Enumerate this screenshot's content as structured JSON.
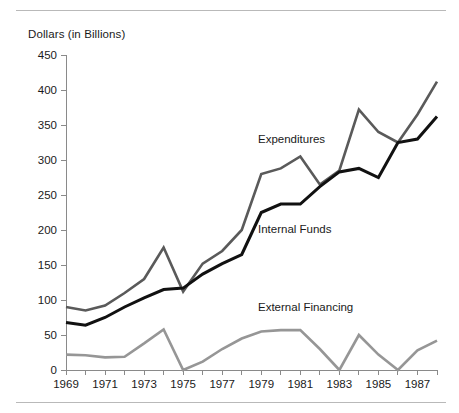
{
  "chart_data": {
    "type": "line",
    "title": "",
    "ylabel": "Dollars (in Billions)",
    "xlabel": "",
    "ylim": [
      0,
      450
    ],
    "ytick_step": 50,
    "ytick_labels": [
      "450",
      "400",
      "350",
      "300",
      "250",
      "200",
      "150",
      "100",
      "50",
      "0"
    ],
    "ytick_values": [
      450,
      400,
      350,
      300,
      250,
      200,
      150,
      100,
      50,
      0
    ],
    "xlim": [
      1969,
      1988
    ],
    "x": [
      1969,
      1970,
      1971,
      1972,
      1973,
      1974,
      1975,
      1976,
      1977,
      1978,
      1979,
      1980,
      1981,
      1982,
      1983,
      1984,
      1985,
      1986,
      1987,
      1988
    ],
    "xtick_labels": [
      "1969",
      "1971",
      "1973",
      "1975",
      "1977",
      "1979",
      "1981",
      "1983",
      "1985",
      "1987"
    ],
    "xtick_values": [
      1969,
      1971,
      1973,
      1975,
      1977,
      1979,
      1981,
      1983,
      1985,
      1987
    ],
    "grid": false,
    "legend_position": "inline-annotations",
    "series": [
      {
        "name": "Expenditures",
        "color": "#5a5a5a",
        "values": [
          90,
          85,
          92,
          110,
          130,
          175,
          112,
          152,
          170,
          200,
          280,
          288,
          305,
          265,
          285,
          372,
          340,
          325,
          365,
          412
        ]
      },
      {
        "name": "Internal Funds",
        "color": "#111111",
        "values": [
          68,
          64,
          75,
          90,
          103,
          115,
          117,
          137,
          152,
          165,
          225,
          237,
          237,
          262,
          283,
          288,
          275,
          325,
          330,
          362
        ]
      },
      {
        "name": "External Financing",
        "color": "#969696",
        "values": [
          22,
          21,
          18,
          19,
          38,
          58,
          0,
          12,
          30,
          45,
          55,
          57,
          57,
          30,
          0,
          50,
          22,
          0,
          28,
          42
        ]
      }
    ],
    "annotations": [
      {
        "text": "Expenditures",
        "x_px": 258,
        "y_px": 143
      },
      {
        "text": "Internal Funds",
        "x_px": 258,
        "y_px": 233
      },
      {
        "text": "External Financing",
        "x_px": 258,
        "y_px": 311
      }
    ]
  },
  "axis": {
    "origin_x_px": 66,
    "origin_y_px": 370,
    "top_y_px": 55,
    "right_x_px": 437
  }
}
